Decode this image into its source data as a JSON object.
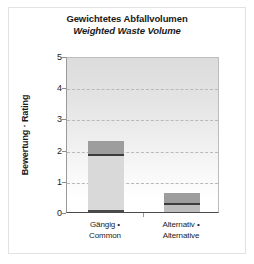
{
  "figure": {
    "width": 254,
    "height": 264,
    "background_color": "#ffffff",
    "frame_color": "#e2e2e2"
  },
  "chart_data": {
    "type": "bar",
    "stacked": true,
    "title": "Gewichtetes Abfallvolumen",
    "subtitle": "Weighted Waste Volume",
    "xlabel": "",
    "ylabel": "Bewertung · Rating",
    "ylim": [
      0,
      5
    ],
    "yticks": [
      0,
      1,
      2,
      3,
      4,
      5
    ],
    "ytick_labels": [
      "0",
      "1",
      "2",
      "3",
      "4",
      "5"
    ],
    "grid": true,
    "grid_axis": "y",
    "grid_style": "dashed",
    "legend": "none",
    "categories": [
      "Gängig · Common",
      "Alternativ · Alternative"
    ],
    "category_lines": [
      [
        "Gängig •",
        "Common"
      ],
      [
        "Alternativ •",
        "Alternative"
      ]
    ],
    "totals": [
      2.27,
      0.6
    ],
    "series": [
      {
        "name": "base",
        "color": "#4a4a4a",
        "values": [
          0.08,
          0.22
        ]
      },
      {
        "name": "body",
        "color": "#d9d9d9",
        "values": [
          1.7,
          0.0
        ]
      },
      {
        "name": "divider",
        "color": "#3c3c3c",
        "values": [
          0.07,
          0.08
        ]
      },
      {
        "name": "cap",
        "color": "#9d9d9d",
        "values": [
          0.42,
          0.3
        ]
      }
    ],
    "bars": [
      {
        "category": "Gängig · Common",
        "total": 2.27,
        "segments": [
          {
            "name": "base",
            "from": 0.0,
            "to": 0.08,
            "color": "#4a4a4a"
          },
          {
            "name": "body",
            "from": 0.08,
            "to": 1.78,
            "color": "#d9d9d9"
          },
          {
            "name": "divider",
            "from": 1.78,
            "to": 1.85,
            "color": "#3c3c3c"
          },
          {
            "name": "cap",
            "from": 1.85,
            "to": 2.27,
            "color": "#9d9d9d"
          }
        ]
      },
      {
        "category": "Alternativ · Alternative",
        "total": 0.6,
        "segments": [
          {
            "name": "base",
            "from": 0.0,
            "to": 0.22,
            "color": "#bdbdbd"
          },
          {
            "name": "divider",
            "from": 0.22,
            "to": 0.3,
            "color": "#3c3c3c"
          },
          {
            "name": "cap",
            "from": 0.3,
            "to": 0.6,
            "color": "#9d9d9d"
          }
        ]
      }
    ],
    "colors": {
      "plot_background_top": "#dcdcdc",
      "plot_background_bottom": "#ffffff",
      "gridline": "#b9b9b9",
      "axis": "#4a4a4a",
      "text": "#1a1a1a"
    }
  }
}
